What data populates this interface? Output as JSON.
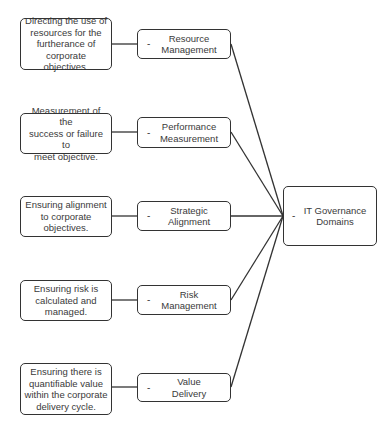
{
  "root": {
    "label": "IT Governance Domains",
    "lines": [
      "IT Governance",
      "Domains"
    ],
    "toggle": "-"
  },
  "domains": [
    {
      "name": "Resource Management",
      "lines": [
        "Resource",
        "Management"
      ],
      "toggle": "-",
      "description": [
        "Directing the use of",
        "resources for the",
        "furtherance of",
        "corporate objectives."
      ]
    },
    {
      "name": "Performance Measurement",
      "lines": [
        "Performance",
        "Measurement"
      ],
      "toggle": "-",
      "description": [
        "Measurement of the",
        "success or failure to",
        "meet objective."
      ]
    },
    {
      "name": "Strategic Alignment",
      "lines": [
        "Strategic",
        "Alignment"
      ],
      "toggle": "-",
      "description": [
        "Ensuring alignment",
        "to corporate",
        "objectives."
      ]
    },
    {
      "name": "Risk Management",
      "lines": [
        "Risk",
        "Management"
      ],
      "toggle": "-",
      "description": [
        "Ensuring risk is",
        "calculated and",
        "managed."
      ]
    },
    {
      "name": "Value Delivery",
      "lines": [
        "Value",
        "Delivery"
      ],
      "toggle": "-",
      "description": [
        "Ensuring there is",
        "quantifiable value",
        "within the corporate",
        "delivery cycle."
      ]
    }
  ]
}
